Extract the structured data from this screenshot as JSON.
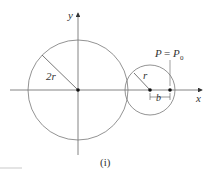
{
  "diagram": {
    "caption": "(i)",
    "axes": {
      "x_label": "x",
      "y_label": "y"
    },
    "large_circle": {
      "radius_label": "2r"
    },
    "small_circle": {
      "radius_label": "r"
    },
    "point": {
      "label_P": "P",
      "label_eq": "=",
      "label_P0": "P",
      "label_P0_sub": "0"
    },
    "offset": {
      "label": "b"
    },
    "colors": {
      "stroke": "#666666",
      "text": "#333333"
    }
  }
}
